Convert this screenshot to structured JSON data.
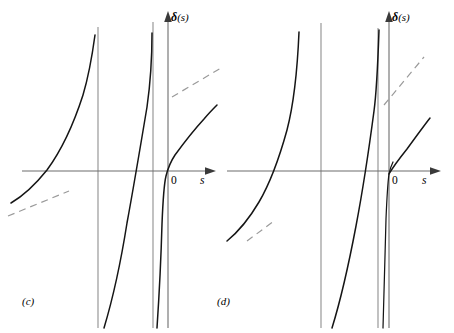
{
  "figure": {
    "background_color": "#ffffff",
    "curve_color": "#151515",
    "axis_color": "#6d6d6d",
    "asymptote_color": "#8a8a8a",
    "dashed_color": "#9a9a9a",
    "width": 454,
    "height": 333
  },
  "panels": [
    {
      "id": "panel-c",
      "tag": "(c)",
      "tag_pos": {
        "x": 24,
        "y": 305
      },
      "y_axis_label": "δ(s)",
      "y_axis_label_text": "(s)",
      "y_axis_label_symbol": "δ",
      "y_axis_label_pos": {
        "x": 172,
        "y": 19
      },
      "x_axis_label": "s",
      "x_axis_label_pos": {
        "x": 203,
        "y": 186
      },
      "origin_label": "0",
      "origin_label_pos": {
        "x": 172,
        "y": 186
      },
      "x_axis": {
        "x1": 22,
        "y1": 171,
        "x2": 214,
        "y2": 171
      },
      "x_axis_arrow": {
        "x": 214,
        "y": 171
      },
      "y_axis": {
        "x1": 168,
        "y1": 14,
        "x2": 168,
        "y2": 328
      },
      "y_axis_arrow": {
        "x": 168,
        "y": 14
      },
      "asymptotes": [
        {
          "x": 98,
          "y1": 27,
          "y2": 328
        },
        {
          "x": 153,
          "y1": 22,
          "y2": 328
        }
      ],
      "branches": [
        "M 11,203 C 22,196 34,186 46,171 C 60,152 72,127 82,96 C 88,76 92,58 95,36",
        "M 104,328 C 112,300 120,262 126,224 C 133,186 140,144 146,108 C 149,87 151,60 152,34",
        "M 157,328 C 159,300 161,262 162,225 C 163,200 164,185 166,176 C 168,168 171,161 175,155 C 182,145 192,132 203,120 C 208,114 212,110 216,106"
      ],
      "dashed": [
        {
          "x1": 8,
          "y1": 216,
          "x2": 69,
          "y2": 191
        },
        {
          "x1": 172,
          "y1": 97,
          "x2": 221,
          "y2": 68
        }
      ]
    },
    {
      "id": "panel-d",
      "tag": "(d)",
      "tag_pos": {
        "x": 219,
        "y": 305
      },
      "y_axis_label": "δ(s)",
      "y_axis_label_text": "(s)",
      "y_axis_label_symbol": "δ",
      "y_axis_label_pos": {
        "x": 393,
        "y": 19
      },
      "x_axis_label": "s",
      "x_axis_label_pos": {
        "x": 424,
        "y": 186
      },
      "origin_label": "0",
      "origin_label_pos": {
        "x": 393,
        "y": 186
      },
      "x_axis": {
        "x1": 227,
        "y1": 171,
        "x2": 439,
        "y2": 171
      },
      "x_axis_arrow": {
        "x": 439,
        "y": 171
      },
      "y_axis": {
        "x1": 389,
        "y1": 14,
        "x2": 389,
        "y2": 328
      },
      "y_axis_arrow": {
        "x": 389,
        "y": 14
      },
      "asymptotes": [
        {
          "x": 321,
          "y1": 23,
          "y2": 328
        },
        {
          "x": 378,
          "y1": 28,
          "y2": 328
        }
      ],
      "branches": [
        "M 227,240 C 237,232 248,220 258,203 C 268,186 278,160 286,131 C 292,108 296,80 299,33",
        "M 332,328 C 340,300 348,264 355,227 C 362,190 368,150 373,112 C 376,90 378,60 379,31",
        "M 382,328 C 383,296 384,256 385,220 C 386,196 387,182 388,175 C 389,170 390,166 392,163",
        "M 388,175 C 392,168 398,160 406,150 C 414,139 422,128 429,119"
      ],
      "dashed": [
        {
          "x1": 247,
          "y1": 241,
          "x2": 274,
          "y2": 221
        },
        {
          "x1": 384,
          "y1": 105,
          "x2": 424,
          "y2": 57
        }
      ]
    }
  ]
}
